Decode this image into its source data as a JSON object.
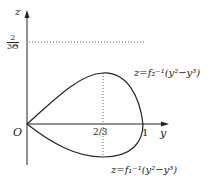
{
  "diagram": {
    "axes": {
      "vertical_label": "z",
      "horizontal_label": "y",
      "origin_label": "O"
    },
    "ticks": {
      "y_two_thirds": "2/3",
      "y_one": "1",
      "z_level_numerator": "2",
      "z_level_denominator": "3Θ"
    },
    "curves": {
      "upper_label": "z=f₂⁻¹(y²−y³)",
      "lower_label": "z=f₁⁻¹(y²−y³)"
    },
    "colors": {
      "stroke": "#222222",
      "dotted": "#666666",
      "background": "#ffffff"
    }
  }
}
